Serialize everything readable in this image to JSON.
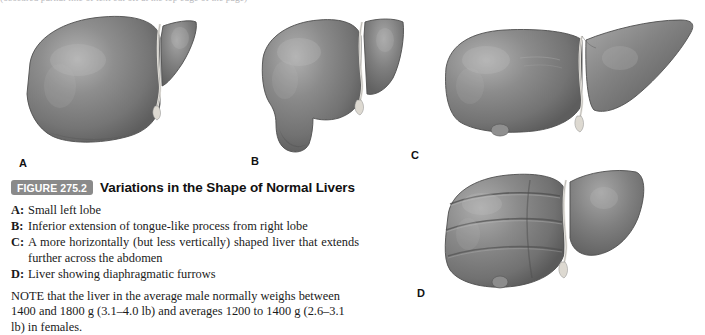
{
  "page": {
    "top_cutoff_text": "(obscured partial line of text cut off at the top edge of the page)"
  },
  "figure": {
    "badge_label": "FIGURE 275.2",
    "title": "Variations in the Shape of Normal Livers",
    "badge_color": "#8a8a8a",
    "badge_text_color": "#ffffff",
    "panels": [
      {
        "letter": "A",
        "name": "liver-illustration-a",
        "description": "Small left lobe"
      },
      {
        "letter": "B",
        "name": "liver-illustration-b",
        "description": "Inferior extension of tongue-like process from right lobe"
      },
      {
        "letter": "C",
        "name": "liver-illustration-c",
        "description": "A more horizontally (but less vertically) shaped liver that extends further across the abdomen"
      },
      {
        "letter": "D",
        "name": "liver-illustration-d",
        "description": "Liver showing diaphragmatic furrows"
      }
    ],
    "legend": [
      {
        "key": "A:",
        "text": "Small left lobe"
      },
      {
        "key": "B:",
        "text": "Inferior extension of tongue-like process from right lobe"
      },
      {
        "key": "C:",
        "text": "A more horizontally (but less vertically) shaped liver that extends further across the abdomen"
      },
      {
        "key": "D:",
        "text": "Liver showing diaphragmatic furrows"
      }
    ],
    "note": "NOTE that the liver in the average male normally weighs between 1400 and 1800 g (3.1–4.0 lb) and averages 1200 to 1400 g (2.6–3.1 lb) in females.",
    "illustration_colors": {
      "liver_tissue_dark": "#6b6b6b",
      "liver_tissue_mid": "#808080",
      "liver_tissue_light": "#a0a0a0",
      "liver_highlight": "#c2c2c2",
      "ligament": "#e8e8e4",
      "outline": "#4a4a4a"
    }
  }
}
